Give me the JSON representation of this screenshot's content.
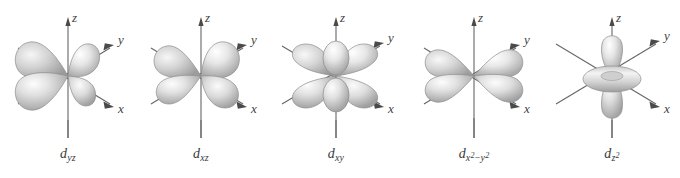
{
  "figure": {
    "background_color": "#ffffff",
    "axis_color": "#4a4a4a",
    "lobe_fill_light": "#f2f2f2",
    "lobe_fill_mid": "#c9c9c9",
    "lobe_fill_dark": "#9a9a9a",
    "lobe_stroke": "#8d8d8d",
    "label_color": "#3a3a3a"
  },
  "axes": {
    "z_label": "z",
    "y_label": "y",
    "x_label": "x"
  },
  "orbitals": [
    {
      "id": "d-yz",
      "label_d": "d",
      "label_sub": "yz",
      "label_plain": "d yz",
      "shape": "four-lobe-cloverleaf",
      "nodal_planes": 2,
      "lobe_orientation": "between y and z axes"
    },
    {
      "id": "d-xz",
      "label_d": "d",
      "label_sub": "xz",
      "label_plain": "d xz",
      "shape": "four-lobe-cloverleaf",
      "nodal_planes": 2,
      "lobe_orientation": "between x and z axes"
    },
    {
      "id": "d-xy",
      "label_d": "d",
      "label_sub": "xy",
      "label_plain": "d xy",
      "shape": "four-lobe-cloverleaf",
      "nodal_planes": 2,
      "lobe_orientation": "between x and y axes"
    },
    {
      "id": "d-x2-y2",
      "label_d": "d",
      "label_sub_x": "x",
      "label_sup_2a": "2",
      "label_minus": "−",
      "label_sub_y": "y",
      "label_sup_2b": "2",
      "label_plain": "d x2 − y2",
      "shape": "four-lobe-cloverleaf",
      "nodal_planes": 2,
      "lobe_orientation": "along x and y axes"
    },
    {
      "id": "d-z2",
      "label_d": "d",
      "label_sub_z": "z",
      "label_sup_2": "2",
      "label_plain": "d z2",
      "shape": "two-lobe-with-torus",
      "nodal_planes": 2,
      "lobe_orientation": "along z axis with equatorial ring"
    }
  ]
}
